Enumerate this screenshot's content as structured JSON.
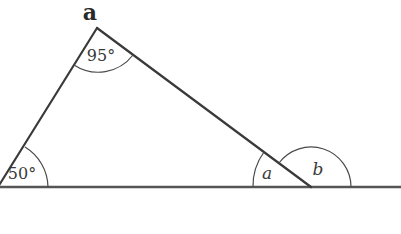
{
  "diagram": {
    "title": "a",
    "type": "triangle-with-exterior-angle",
    "labels": {
      "apex_angle": "95°",
      "left_angle": "50°",
      "interior_unknown": "a",
      "exterior_unknown": "b"
    },
    "colors": {
      "lines": "#3a3a3a",
      "baseline": "#555555",
      "background": "#ffffff"
    }
  }
}
